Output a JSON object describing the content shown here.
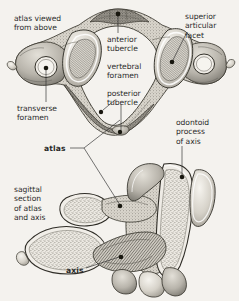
{
  "plate": {
    "background_color": "#f4f2ee",
    "ink_color": "#2b2b2b",
    "bone_light": "#e9e6df",
    "bone_mid": "#b5b1a8",
    "bone_dark": "#6d6a63"
  },
  "labels": {
    "atlas_viewed_from_above": "atlas viewed\nfrom above",
    "superior_articular_facet": "superior\narticular\nfacet",
    "anterior_tubercle": "anterior\ntubercle",
    "vertebral_foramen": "vertebral\nforamen",
    "posterior_tubercle": "posterior\ntubercle",
    "transverse_foramen": "transverse\nforamen",
    "odontoid_process_of_axis": "odontoid\nprocess\nof axis",
    "atlas": "atlas",
    "sagittal_section_of_atlas_and_axis": "sagittal\nsection\nof atlas\nand axis",
    "axis": "axis"
  },
  "diagram_data": {
    "type": "anatomical-illustration",
    "subject": "Cervical vertebrae C1 (atlas) and C2 (axis)",
    "figure_count": 2,
    "figures": [
      {
        "name": "atlas-superior-view",
        "caption": "atlas viewed from above",
        "view": "superior",
        "annotated_structures": [
          "anterior tubercle",
          "vertebral foramen",
          "posterior tubercle",
          "transverse foramen",
          "superior articular facet"
        ]
      },
      {
        "name": "atlas-axis-sagittal-section",
        "caption": "sagittal section of atlas and axis",
        "view": "midsagittal",
        "annotated_structures": [
          "atlas",
          "axis",
          "odontoid process of axis"
        ]
      }
    ],
    "leader_dots": [
      {
        "label": "anterior_tubercle",
        "x": 118,
        "y": 14
      },
      {
        "label": "posterior_tubercle",
        "x": 101,
        "y": 112
      },
      {
        "label": "posterior_tubercle_lower",
        "x": 120,
        "y": 132
      },
      {
        "label": "transverse_foramen",
        "x": 46,
        "y": 72
      },
      {
        "label": "superior_articular_facet",
        "x": 172,
        "y": 64
      },
      {
        "label": "odontoid_process_of_axis",
        "x": 182,
        "y": 178
      },
      {
        "label": "atlas_sagittal",
        "x": 120,
        "y": 207
      },
      {
        "label": "axis_sagittal",
        "x": 121,
        "y": 258
      }
    ]
  }
}
